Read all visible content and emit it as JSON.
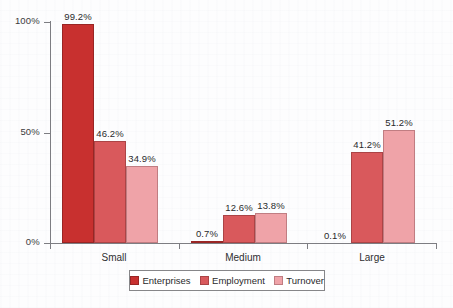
{
  "chart_data": {
    "type": "bar",
    "title": "",
    "subtitle": "",
    "xlabel": "",
    "ylabel": "",
    "categories": [
      "Small",
      "Medium",
      "Large"
    ],
    "series": [
      {
        "name": "Enterprises",
        "color": "#c8302f",
        "values": [
          99.2,
          0.7,
          0.1
        ],
        "labels": [
          "99.2%",
          "0.7%",
          "0.1%"
        ]
      },
      {
        "name": "Employment",
        "color": "#d9595c",
        "values": [
          46.2,
          12.6,
          41.2
        ],
        "labels": [
          "46.2%",
          "12.6%",
          "41.2%"
        ]
      },
      {
        "name": "Turnover",
        "color": "#efa3a8",
        "values": [
          34.9,
          13.8,
          51.2
        ],
        "labels": [
          "34.9%",
          "13.8%",
          "51.2%"
        ]
      }
    ],
    "ylim": [
      0,
      100
    ],
    "yticks": [
      0,
      50,
      100
    ],
    "ytick_labels": [
      "0%",
      "50%",
      "100%"
    ],
    "xtick_labels": [
      "Small",
      "Medium",
      "Large"
    ],
    "grid": false,
    "legend_position": "bottom",
    "value_labels_shown": true,
    "units": "percent"
  },
  "legend": {
    "items": [
      {
        "label": "Enterprises",
        "color": "#c8302f"
      },
      {
        "label": "Employment",
        "color": "#d9595c"
      },
      {
        "label": "Turnover",
        "color": "#efa3a8"
      }
    ]
  },
  "axes": {
    "y_labels": [
      "100%",
      "50%",
      "0%"
    ],
    "x_labels": [
      "Small",
      "Medium",
      "Large"
    ]
  },
  "caption": {
    "text": ""
  },
  "colors": {
    "enterprises": "#c8302f",
    "employment": "#d9595c",
    "turnover": "#efa3a8",
    "axis": "#7d7d82",
    "text": "#2a2a2c",
    "background": "#fdfdfe"
  }
}
